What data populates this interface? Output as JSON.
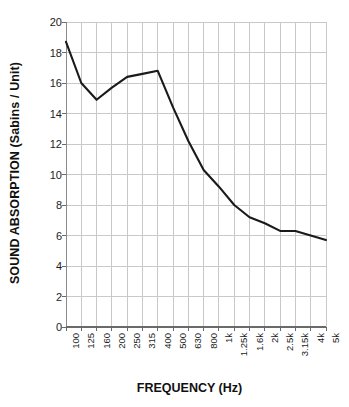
{
  "chart_data": {
    "type": "line",
    "title": "",
    "xlabel": "FREQUENCY (Hz)",
    "ylabel": "SOUND ABSORPTION (Sabins / Unit)",
    "categories": [
      "100",
      "125",
      "160",
      "200",
      "250",
      "315",
      "400",
      "500",
      "630",
      "800",
      "1k",
      "1.25k",
      "1.6k",
      "2k",
      "2.5k",
      "3.15k",
      "4k",
      "5k"
    ],
    "values": [
      18.7,
      16.0,
      14.9,
      15.7,
      16.4,
      16.6,
      16.8,
      14.4,
      12.2,
      10.3,
      9.2,
      8.0,
      7.2,
      6.8,
      6.3,
      6.3,
      6.0,
      5.7
    ],
    "series": [
      {
        "name": "Sound Absorption",
        "values": [
          18.7,
          16.0,
          14.9,
          15.7,
          16.4,
          16.6,
          16.8,
          14.4,
          12.2,
          10.3,
          9.2,
          8.0,
          7.2,
          6.8,
          6.3,
          6.3,
          6.0,
          5.7
        ]
      }
    ],
    "ylim": [
      0,
      20
    ],
    "yticks": [
      "0",
      "2",
      "4",
      "6",
      "8",
      "10",
      "12",
      "14",
      "16",
      "18",
      "20"
    ],
    "ytick_values": [
      0,
      2,
      4,
      6,
      8,
      10,
      12,
      14,
      16,
      18,
      20
    ],
    "grid": true,
    "grid_color": "#c9c9c9",
    "line_color": "#1a1a1a",
    "line_width": 2.1,
    "legend": null,
    "legend_position": "none",
    "background": "#ffffff",
    "markers": false
  }
}
